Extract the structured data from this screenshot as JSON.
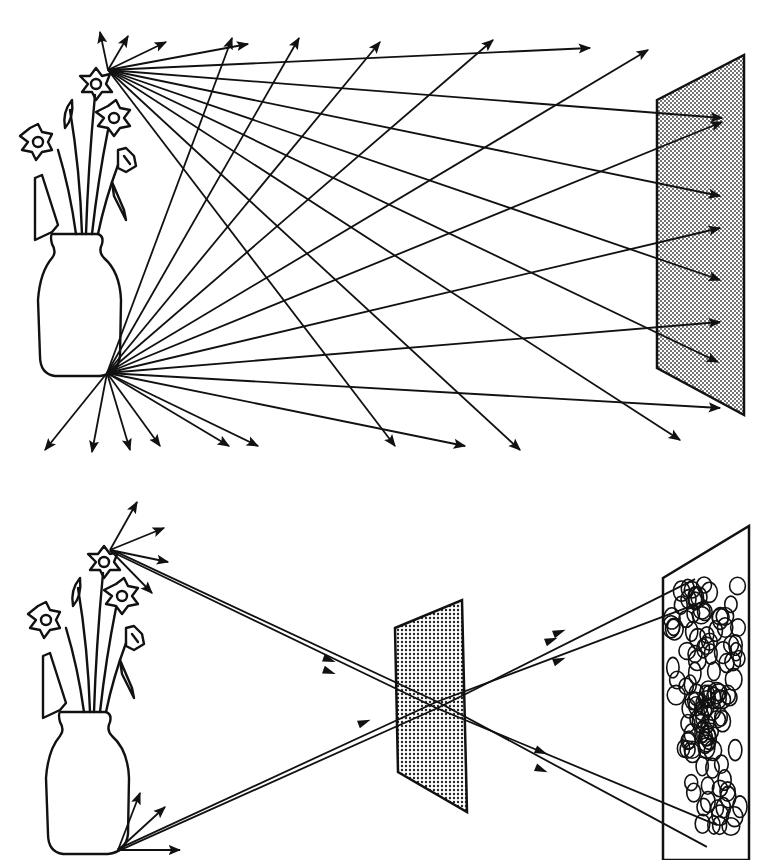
{
  "diagram": {
    "title": "",
    "colors": {
      "ink": "#111111",
      "background": "#ffffff",
      "screen_fill": "#bdbdbd"
    },
    "top_panel": {
      "description": "Object without pinhole: light rays from every point scatter onto the screen, no image forms",
      "flower_point": [
        108,
        70
      ],
      "vase_point": [
        107,
        373
      ],
      "screen": {
        "points": [
          [
            657,
            100
          ],
          [
            744,
            55
          ],
          [
            744,
            415
          ],
          [
            657,
            368
          ]
        ]
      },
      "flower_rays": [
        [
          100,
          32
        ],
        [
          128,
          36
        ],
        [
          166,
          42
        ],
        [
          248,
          44
        ],
        [
          590,
          48
        ],
        [
          722,
          118
        ],
        [
          720,
          196
        ],
        [
          720,
          280
        ],
        [
          718,
          362
        ],
        [
          680,
          440
        ],
        [
          520,
          450
        ],
        [
          395,
          446
        ]
      ],
      "vase_rays": [
        [
          232,
          38
        ],
        [
          299,
          38
        ],
        [
          380,
          42
        ],
        [
          493,
          40
        ],
        [
          648,
          50
        ],
        [
          722,
          122
        ],
        [
          720,
          228
        ],
        [
          720,
          322
        ],
        [
          720,
          408
        ],
        [
          465,
          446
        ],
        [
          258,
          446
        ],
        [
          229,
          446
        ],
        [
          160,
          446
        ],
        [
          130,
          450
        ],
        [
          92,
          452
        ],
        [
          45,
          450
        ]
      ]
    },
    "bottom_panel": {
      "description": "Pinhole screen: narrow bundles of rays cross at the pinhole and form an inverted, blurred image",
      "flower_point": [
        110,
        550
      ],
      "vase_point": [
        118,
        850
      ],
      "pinhole": [
        437,
        705
      ],
      "barrier": {
        "points": [
          [
            395,
            628
          ],
          [
            462,
            600
          ],
          [
            467,
            812
          ],
          [
            398,
            772
          ]
        ]
      },
      "image_screen": {
        "points": [
          [
            663,
            578
          ],
          [
            749,
            526
          ],
          [
            749,
            860
          ],
          [
            663,
            860
          ]
        ]
      },
      "flower_short_rays": [
        [
          137,
          502
        ],
        [
          164,
          528
        ],
        [
          168,
          562
        ],
        [
          152,
          593
        ]
      ],
      "vase_short_rays": [
        [
          140,
          793
        ],
        [
          165,
          807
        ],
        [
          180,
          850
        ]
      ],
      "image_blob_circles": 120
    }
  }
}
